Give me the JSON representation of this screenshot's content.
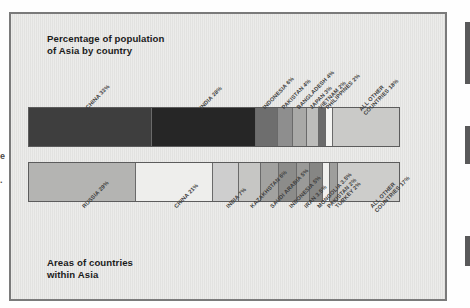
{
  "figure": {
    "top_title": "Percentage of population\nof Asia by country",
    "bottom_title": "Areas of countries\nwithin Asia",
    "left_clipped_marks": [
      "e",
      "."
    ]
  },
  "chart_data": [
    {
      "type": "bar",
      "orientation": "horizontal-stacked",
      "title": "Percentage of population of Asia by country",
      "xlabel": "",
      "ylabel": "",
      "xlim": [
        0,
        100
      ],
      "grid": false,
      "legend": "none",
      "units": "percent",
      "categories": [
        "CHINA",
        "INDIA",
        "INDONESIA",
        "PAKISTAN",
        "BANGLADESH",
        "JAPAN",
        "VIETNAM",
        "PHILIPPINES",
        "ALL OTHER COUNTRIES"
      ],
      "values": [
        33,
        28,
        6,
        4,
        4,
        3,
        2,
        2,
        18
      ],
      "labels": [
        "CHINA 33%",
        "INDIA 28%",
        "INDONESIA 6%",
        "PAKISTAN 4%",
        "BANGLADESH 4%",
        "JAPAN 3%",
        "VIETNAM 2%",
        "PHILIPPINES 2%",
        "ALL OTHER\nCOUNTRIES 18%"
      ],
      "colors": [
        "#3e3e3e",
        "#262626",
        "#6e6e6e",
        "#8e8e8e",
        "#a9a9a7",
        "#bdbdbb",
        "#6b6b6b",
        "#f4f4f2",
        "#cacac8"
      ]
    },
    {
      "type": "bar",
      "orientation": "horizontal-stacked",
      "title": "Areas of countries within Asia",
      "xlabel": "",
      "ylabel": "",
      "xlim": [
        0,
        100
      ],
      "grid": false,
      "legend": "none",
      "units": "percent",
      "categories": [
        "RUSSIA",
        "CHINA",
        "INDIA",
        "KAZAKHSTAN",
        "SAUDI ARABIA",
        "INDONESIA",
        "IRAN",
        "MONGOLIA",
        "PAKISTAN",
        "TURKEY",
        "ALL OTHER COUNTRIES"
      ],
      "values": [
        29,
        21,
        7,
        6,
        5,
        5,
        3.5,
        3.5,
        2,
        2,
        17
      ],
      "labels": [
        "RUSSIA 29%",
        "CHINA 21%",
        "INDIA 7%",
        "KAZAKHSTAN 6%",
        "SAUDI ARABIA 5%",
        "INDONESIA 5%",
        "IRAN 3.5%",
        "MONGOLIA 3.5%",
        "PAKISTAN 2%",
        "TURKEY 2%",
        "ALL OTHER\nCOUNTRIES 17%"
      ],
      "colors": [
        "#b4b4b2",
        "#eeeeec",
        "#cecece",
        "#c6c6c4",
        "#a2a2a0",
        "#8c8c8a",
        "#9a9a98",
        "#868684",
        "#f0f0ee",
        "#9e9e9c",
        "#cdcdcb"
      ]
    }
  ]
}
